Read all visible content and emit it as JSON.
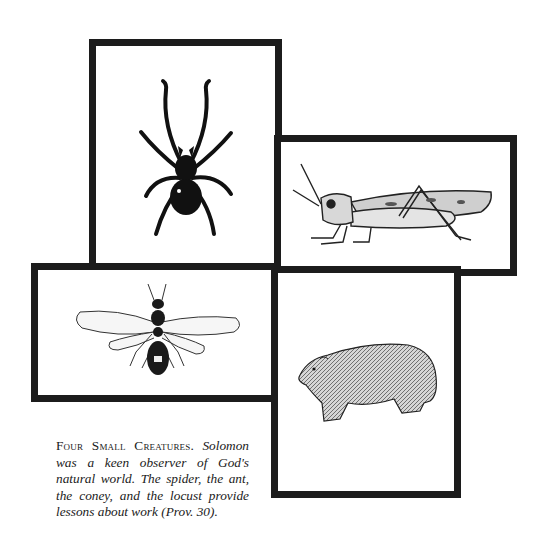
{
  "figure": {
    "panels": [
      {
        "id": "spider",
        "label": "spider illustration"
      },
      {
        "id": "locust",
        "label": "locust illustration"
      },
      {
        "id": "ant",
        "label": "winged ant illustration"
      },
      {
        "id": "coney",
        "label": "coney (rock hyrax) illustration"
      }
    ],
    "border_color": "#1c1c1c"
  },
  "caption": {
    "title": "Four Small Creatures.",
    "body": "Solomon was a keen observer of God's natural world. The spider, the ant, the coney, and the locust provide lessons about work (Prov. 30)."
  }
}
